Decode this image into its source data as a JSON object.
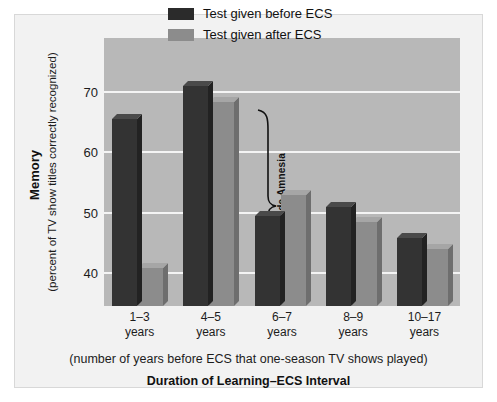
{
  "chart_data": {
    "type": "bar",
    "title": "",
    "categories": [
      "1–3\nyears",
      "4–5\nyears",
      "6–7\nyears",
      "8–9\nyears",
      "10–17\nyears"
    ],
    "category_lines": [
      [
        "1–3",
        "years"
      ],
      [
        "4–5",
        "years"
      ],
      [
        "6–7",
        "years"
      ],
      [
        "8–9",
        "years"
      ],
      [
        "10–17",
        "years"
      ]
    ],
    "series": [
      {
        "name": "Test given before ECS",
        "color": "#333333",
        "values": [
          65.6,
          71.0,
          49.5,
          51.0,
          45.8
        ]
      },
      {
        "name": "Test given after ECS",
        "color": "#8c8c8c",
        "values": [
          40.8,
          68.3,
          53.0,
          48.5,
          44.0
        ]
      }
    ],
    "xlabel": "Duration of Learning–ECS Interval",
    "xlabel_sub": "(number of years before ECS that one-season TV shows played)",
    "ylabel": "Memory",
    "ylabel_sub": "(percent of TV show titles correctly recognized)",
    "yticks": [
      40,
      50,
      60,
      70
    ],
    "ytick_labels": [
      "40",
      "50",
      "60",
      "70"
    ],
    "ylim": [
      34.5,
      79
    ],
    "grid": true,
    "legend_position": "top-right",
    "annotations": [
      {
        "name": "retrograde-amnesia-brace",
        "text": "Retrograde Amnesia"
      }
    ]
  },
  "legend": {
    "items": [
      {
        "label": "Test given before ECS",
        "swatch": "dark"
      },
      {
        "label": "Test given after ECS",
        "swatch": "light"
      }
    ]
  },
  "colors": {
    "plot_background": "#b8b8b8",
    "figure_background": "#f2f2f2",
    "gridline": "#f4f4f4",
    "series_before": "#333333",
    "series_after": "#8c8c8c"
  }
}
